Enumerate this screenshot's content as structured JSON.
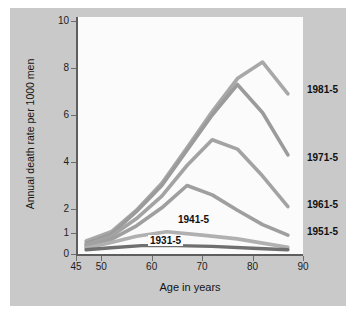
{
  "figure": {
    "background_color": "#c9c9c9",
    "plot_background_color": "#fbfbfb",
    "axis_color": "#5e5e5e"
  },
  "chart_data": {
    "type": "line",
    "title": "",
    "xlabel": "Age in years",
    "ylabel": "Annual death rate per 1000 men",
    "xlim": [
      45,
      90
    ],
    "ylim": [
      0,
      10
    ],
    "xticks": [
      45,
      50,
      60,
      70,
      80,
      90
    ],
    "yticks": [
      0,
      1,
      2,
      4,
      6,
      8,
      10
    ],
    "y_scale_note": "compressed below 2",
    "grid": false,
    "legend_position": "right-inline",
    "series": [
      {
        "name": "1981-5",
        "color": "#a8a8a8",
        "label_position": "right",
        "points": [
          {
            "x": 47,
            "y": 0.62
          },
          {
            "x": 52,
            "y": 1.05
          },
          {
            "x": 57,
            "y": 1.95
          },
          {
            "x": 62,
            "y": 3.1
          },
          {
            "x": 67,
            "y": 4.6
          },
          {
            "x": 72,
            "y": 6.15
          },
          {
            "x": 77,
            "y": 7.55
          },
          {
            "x": 82,
            "y": 8.25
          },
          {
            "x": 87,
            "y": 6.9
          }
        ]
      },
      {
        "name": "1971-5",
        "color": "#9b9b9b",
        "label_position": "right",
        "points": [
          {
            "x": 47,
            "y": 0.5
          },
          {
            "x": 52,
            "y": 0.95
          },
          {
            "x": 57,
            "y": 1.9
          },
          {
            "x": 62,
            "y": 3.0
          },
          {
            "x": 67,
            "y": 4.5
          },
          {
            "x": 72,
            "y": 6.0
          },
          {
            "x": 77,
            "y": 7.3
          },
          {
            "x": 82,
            "y": 6.1
          },
          {
            "x": 87,
            "y": 4.3
          }
        ]
      },
      {
        "name": "1961-5",
        "color": "#a3a3a3",
        "label_position": "right",
        "points": [
          {
            "x": 47,
            "y": 0.42
          },
          {
            "x": 52,
            "y": 0.85
          },
          {
            "x": 57,
            "y": 1.6
          },
          {
            "x": 62,
            "y": 2.55
          },
          {
            "x": 67,
            "y": 3.85
          },
          {
            "x": 72,
            "y": 4.95
          },
          {
            "x": 77,
            "y": 4.55
          },
          {
            "x": 82,
            "y": 3.4
          },
          {
            "x": 87,
            "y": 2.1
          }
        ]
      },
      {
        "name": "1951-5",
        "color": "#9f9f9f",
        "label_position": "right",
        "points": [
          {
            "x": 47,
            "y": 0.35
          },
          {
            "x": 52,
            "y": 0.7
          },
          {
            "x": 57,
            "y": 1.3
          },
          {
            "x": 62,
            "y": 2.05
          },
          {
            "x": 67,
            "y": 3.0
          },
          {
            "x": 72,
            "y": 2.6
          },
          {
            "x": 77,
            "y": 1.95
          },
          {
            "x": 82,
            "y": 1.35
          },
          {
            "x": 87,
            "y": 0.9
          }
        ]
      },
      {
        "name": "1941-5",
        "color": "#b0b0b0",
        "label_position": "inline",
        "points": [
          {
            "x": 47,
            "y": 0.28
          },
          {
            "x": 52,
            "y": 0.55
          },
          {
            "x": 57,
            "y": 0.85
          },
          {
            "x": 63,
            "y": 1.05
          },
          {
            "x": 70,
            "y": 0.9
          },
          {
            "x": 77,
            "y": 0.72
          },
          {
            "x": 82,
            "y": 0.52
          },
          {
            "x": 87,
            "y": 0.32
          }
        ]
      },
      {
        "name": "1931-5",
        "color": "#6f6f6f",
        "label_position": "inline",
        "points": [
          {
            "x": 47,
            "y": 0.2
          },
          {
            "x": 52,
            "y": 0.3
          },
          {
            "x": 58,
            "y": 0.4
          },
          {
            "x": 65,
            "y": 0.4
          },
          {
            "x": 72,
            "y": 0.36
          },
          {
            "x": 80,
            "y": 0.27
          },
          {
            "x": 87,
            "y": 0.2
          }
        ]
      }
    ]
  }
}
